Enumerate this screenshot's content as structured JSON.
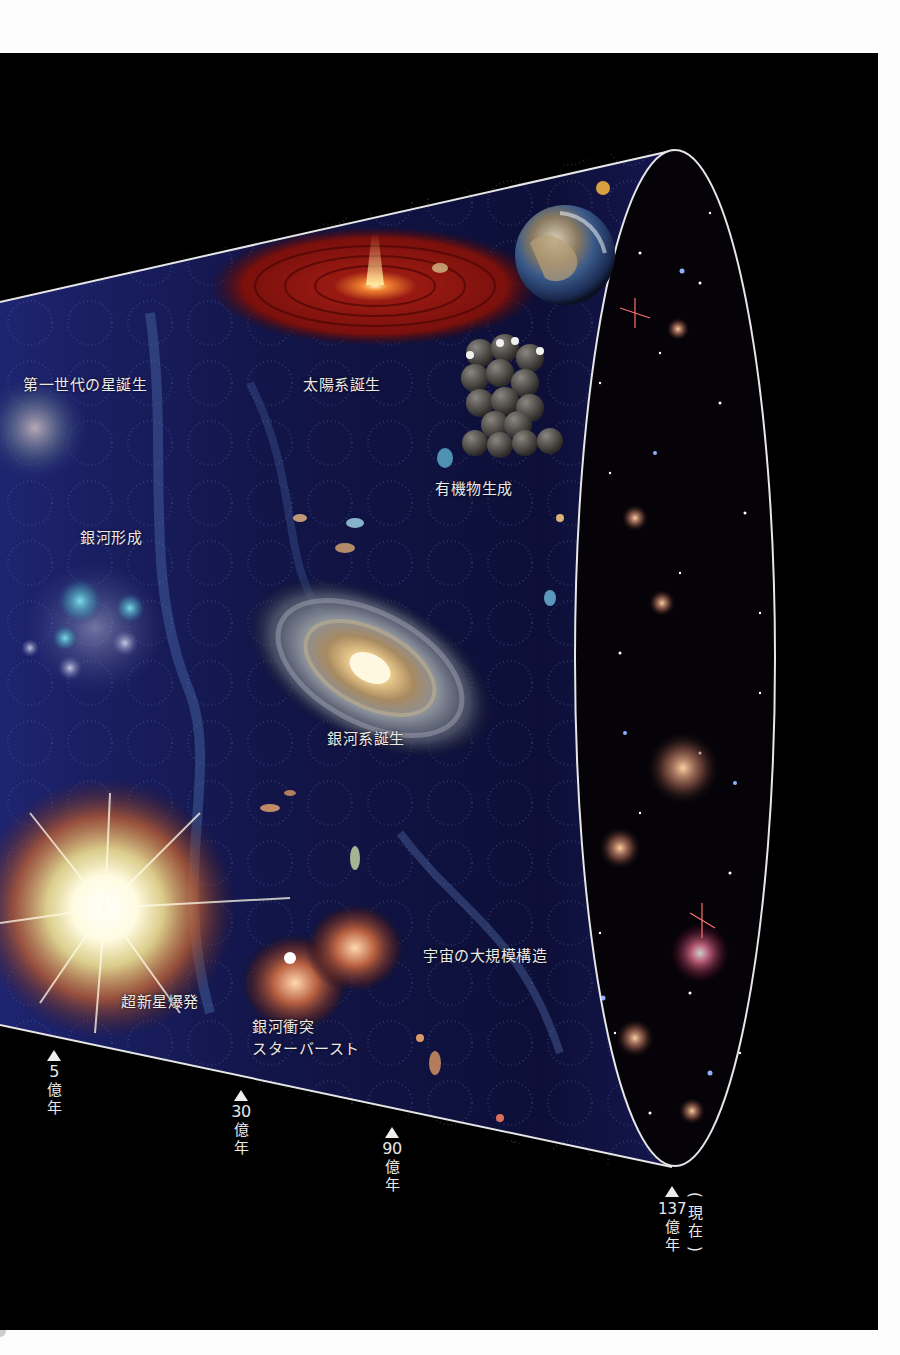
{
  "figure": {
    "title_implied": "宇宙の歴史",
    "colors": {
      "background_page": "#fdfdfd",
      "background_plate": "#000000",
      "cone_fill_deep": "#1a1a5e",
      "cone_fill_mid": "#2a2a7a",
      "outline": "#e6e6e6",
      "label_text": "#eceae6",
      "solar_disk": "#8a1410",
      "galaxy_core": "#ffe6a8"
    }
  },
  "labels": {
    "first_stars": "第一世代の星誕生",
    "solar_system": "太陽系誕生",
    "organic_matter": "有機物生成",
    "galaxy_formation": "銀河形成",
    "milky_way": "銀河系誕生",
    "supernova": "超新星爆発",
    "galaxy_collision_line1": "銀河衝突",
    "galaxy_collision_line2": "スターバースト",
    "large_scale_structure": "宇宙の大規模構造"
  },
  "timeline": {
    "markers": [
      {
        "value": "5",
        "unit1": "億",
        "unit2": "年"
      },
      {
        "value": "30",
        "unit1": "億",
        "unit2": "年"
      },
      {
        "value": "90",
        "unit1": "億",
        "unit2": "年"
      },
      {
        "value": "137",
        "unit1": "億",
        "unit2": "年",
        "note_open": "(",
        "note1": "現",
        "note2": "在",
        "note_close": ")"
      }
    ]
  },
  "icons": {
    "earth": "earth-illustration",
    "spiral_galaxy": "spiral-galaxy-illustration",
    "supernova": "supernova-burst-illustration",
    "molecule": "organic-molecule-illustration",
    "protoplanetary_disk": "protoplanetary-disk-illustration",
    "colliding_galaxies": "colliding-galaxies-illustration",
    "triangle_marker": "triangle-up-icon"
  }
}
